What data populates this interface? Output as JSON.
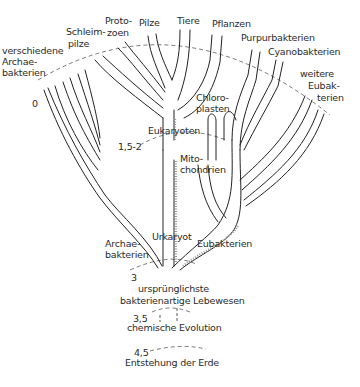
{
  "diagram": {
    "top_labels": {
      "archae_various": [
        "verschiedene",
        "Archae-",
        "bakterien"
      ],
      "schleimpilze": [
        "Schleim-",
        "pilze"
      ],
      "protozoen": [
        "Proto-",
        "zoen"
      ],
      "pilze": "Pilze",
      "tiere": "Tiere",
      "pflanzen": "Pflanzen",
      "purpurbakterien": "Purpurbakterien",
      "cyanobakterien": "Cyanobakterien",
      "weitere_eubakterien": [
        "weitere",
        "Eubak-",
        "terien"
      ]
    },
    "inner_labels": {
      "chloroplasten": [
        "Chloro-",
        "plasten"
      ],
      "eukaryoten": "Eukaryoten",
      "mitochondrien": [
        "Mito-",
        "chondrien"
      ],
      "urkaryot": "Urkaryot",
      "archaebakterien": [
        "Archae-",
        "bakterien"
      ],
      "eubakterien": "Eubakterien",
      "urspruenglichste": [
        "ursprünglichste",
        "bakterienartige Lebewesen"
      ],
      "chemische_evolution": "chemische Evolution",
      "entstehung": "Entstehung der Erde"
    },
    "time_markers": {
      "t0": "0",
      "t1": "1,5-2",
      "t2": "3",
      "t3": "3,5",
      "t4": "4,5"
    }
  }
}
